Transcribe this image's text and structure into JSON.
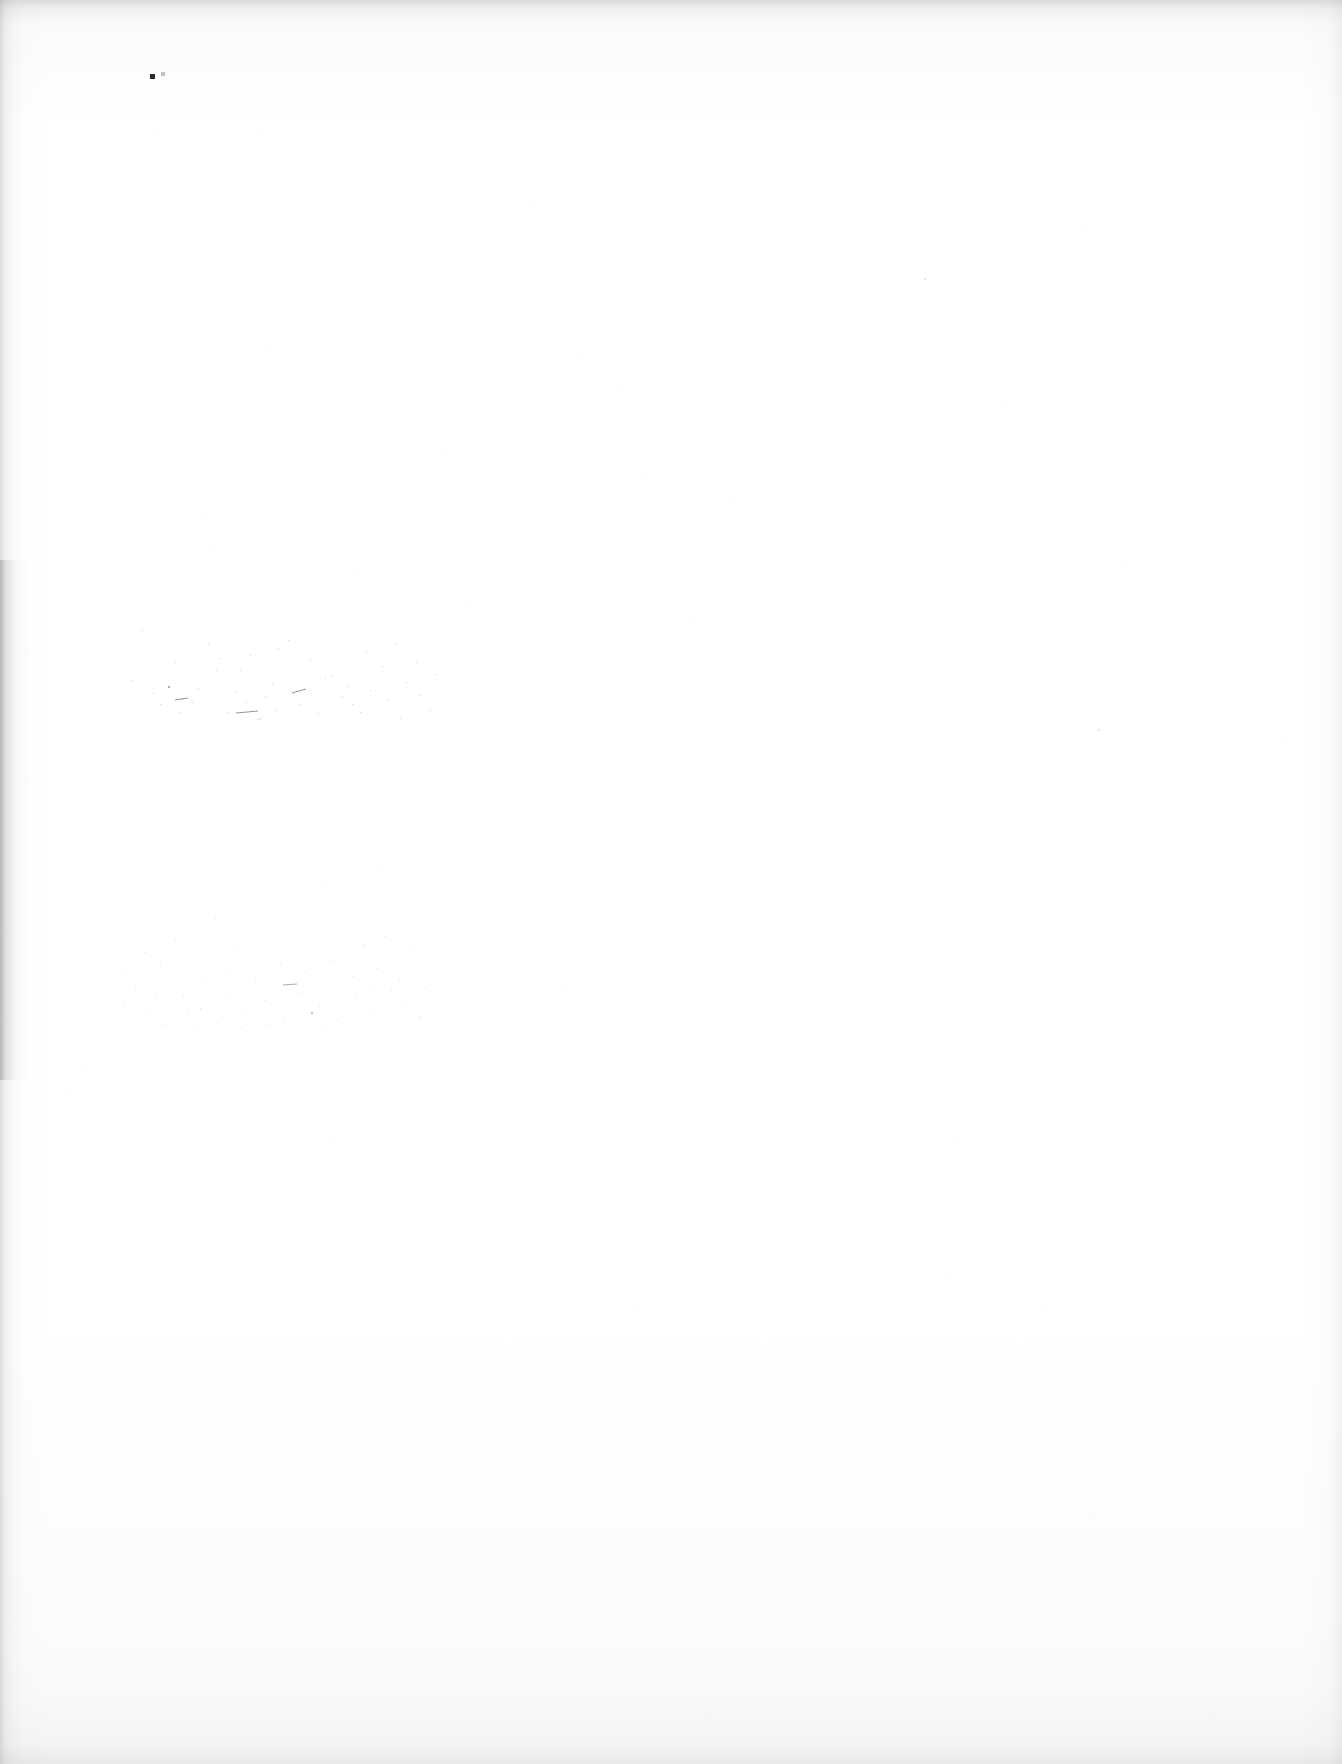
{
  "page": {
    "kind": "scanned-blank-page",
    "width": 1342,
    "height": 1764,
    "visible_text": "",
    "note": ""
  },
  "colors": {
    "paper": "#ffffff",
    "paper_tint": "#fbfbfb",
    "edge_shadow": "#7a7c80",
    "speck_dark": "#2a2a2c",
    "speck_light": "#9a9a9e"
  },
  "artifacts": {
    "dark_speck": {
      "x": 150,
      "y": 74,
      "size": 5
    },
    "dark_speck_companion": {
      "x": 161,
      "y": 72,
      "size": 4
    },
    "smudge_bands": [
      {
        "name": "upper-left-smudge",
        "x": 120,
        "y": 600,
        "width": 330,
        "height": 120
      },
      {
        "name": "lower-left-smudge",
        "x": 105,
        "y": 900,
        "width": 330,
        "height": 130
      }
    ],
    "edges": {
      "left_shadow_width": 46,
      "right_shadow_width": 40,
      "top_band_height": 34,
      "bottom_band_height": 70
    }
  },
  "specks_generic": [
    [
      153,
      131,
      1
    ],
    [
      258,
      135,
      1
    ],
    [
      530,
      202,
      1
    ],
    [
      1083,
      227,
      1
    ],
    [
      924,
      278,
      2
    ],
    [
      266,
      350,
      1
    ],
    [
      577,
      355,
      1
    ],
    [
      1003,
      402,
      1
    ],
    [
      616,
      389,
      1
    ],
    [
      641,
      479,
      1
    ],
    [
      206,
      519,
      1
    ],
    [
      210,
      551,
      1
    ],
    [
      356,
      568,
      1
    ],
    [
      1124,
      560,
      1
    ],
    [
      1098,
      729,
      2
    ],
    [
      1283,
      742,
      1
    ],
    [
      20,
      637,
      1
    ],
    [
      28,
      654,
      1
    ],
    [
      13,
      723,
      1
    ],
    [
      15,
      757,
      1
    ],
    [
      24,
      782,
      1
    ],
    [
      9,
      812,
      1
    ],
    [
      12,
      835,
      1
    ],
    [
      17,
      880,
      1
    ],
    [
      6,
      930,
      1
    ],
    [
      9,
      955,
      1
    ],
    [
      14,
      988,
      1
    ],
    [
      18,
      1010,
      1
    ],
    [
      11,
      1038,
      1
    ],
    [
      22,
      1062,
      1
    ],
    [
      378,
      866,
      1
    ],
    [
      323,
      884,
      1
    ],
    [
      560,
      986,
      1
    ],
    [
      372,
      990,
      1
    ],
    [
      27,
      1092,
      1
    ],
    [
      330,
      1138,
      1
    ],
    [
      955,
      1143,
      1
    ],
    [
      944,
      1272,
      1
    ],
    [
      1043,
      1306,
      1
    ],
    [
      1071,
      1424,
      1
    ],
    [
      633,
      1307,
      1
    ],
    [
      548,
      1353,
      1
    ],
    [
      755,
      1404,
      1
    ],
    [
      319,
      1452,
      1
    ],
    [
      1165,
      1479,
      1
    ],
    [
      410,
      1497,
      1
    ],
    [
      1088,
      1514,
      1
    ],
    [
      264,
      1562,
      1
    ],
    [
      612,
      1576,
      1
    ],
    [
      859,
      1594,
      1
    ],
    [
      450,
      1626,
      1
    ],
    [
      990,
      1651,
      1
    ],
    [
      137,
      1683,
      1
    ],
    [
      706,
      1712,
      1
    ],
    [
      1210,
      1716,
      1
    ],
    [
      84,
      1064,
      1
    ],
    [
      66,
      1091,
      1
    ],
    [
      443,
      451,
      1
    ],
    [
      470,
      601,
      1
    ],
    [
      735,
      497,
      1
    ],
    [
      688,
      620,
      1
    ]
  ],
  "specks_band_a": [
    [
      22,
      30,
      1
    ],
    [
      145,
      96,
      1
    ],
    [
      190,
      60,
      1
    ],
    [
      212,
      75,
      1
    ],
    [
      228,
      86,
      1
    ],
    [
      246,
      51,
      1
    ],
    [
      205,
      78,
      1
    ],
    [
      168,
      40,
      1
    ],
    [
      130,
      55,
      1
    ],
    [
      96,
      70,
      1
    ],
    [
      78,
      88,
      1
    ],
    [
      62,
      99,
      1
    ],
    [
      40,
      104,
      1
    ],
    [
      115,
      92,
      1
    ],
    [
      155,
      110,
      1
    ],
    [
      180,
      104,
      1
    ],
    [
      198,
      113,
      1
    ],
    [
      222,
      96,
      1
    ],
    [
      250,
      90,
      1
    ],
    [
      268,
      100,
      1
    ],
    [
      286,
      82,
      1
    ],
    [
      300,
      95,
      1
    ],
    [
      140,
      118,
      1
    ],
    [
      170,
      120,
      1
    ],
    [
      12,
      80,
      1
    ],
    [
      55,
      62,
      1
    ],
    [
      88,
      44,
      1
    ],
    [
      262,
      66,
      1
    ],
    [
      280,
      118,
      1
    ],
    [
      310,
      110,
      1
    ],
    [
      48,
      86,
      2
    ],
    [
      72,
      102,
      1
    ],
    [
      108,
      112,
      1
    ],
    [
      126,
      102,
      1
    ],
    [
      214,
      120,
      1
    ],
    [
      240,
      112,
      1
    ],
    [
      33,
      93,
      1
    ],
    [
      60,
      112,
      1
    ],
    [
      92,
      120,
      1
    ],
    [
      152,
      84,
      1
    ],
    [
      188,
      90,
      1
    ],
    [
      232,
      104,
      1
    ],
    [
      158,
      48,
      1
    ],
    [
      276,
      44,
      1
    ],
    [
      296,
      62,
      1
    ],
    [
      316,
      74,
      1
    ],
    [
      120,
      70,
      1
    ],
    [
      100,
      58,
      1
    ]
  ],
  "specks_band_b": [
    [
      110,
      18,
      1
    ],
    [
      70,
      40,
      1
    ],
    [
      55,
      62,
      1
    ],
    [
      30,
      86,
      1
    ],
    [
      18,
      102,
      1
    ],
    [
      44,
      110,
      1
    ],
    [
      78,
      96,
      1
    ],
    [
      95,
      108,
      1
    ],
    [
      120,
      94,
      1
    ],
    [
      140,
      112,
      1
    ],
    [
      160,
      100,
      1
    ],
    [
      178,
      118,
      1
    ],
    [
      196,
      92,
      1
    ],
    [
      214,
      106,
      1
    ],
    [
      232,
      120,
      1
    ],
    [
      250,
      98,
      1
    ],
    [
      268,
      110,
      1
    ],
    [
      286,
      90,
      1
    ],
    [
      300,
      104,
      1
    ],
    [
      315,
      116,
      1
    ],
    [
      125,
      70,
      1
    ],
    [
      150,
      78,
      1
    ],
    [
      175,
      64,
      1
    ],
    [
      200,
      72,
      1
    ],
    [
      225,
      60,
      1
    ],
    [
      248,
      76,
      1
    ],
    [
      272,
      68,
      1
    ],
    [
      294,
      80,
      1
    ],
    [
      60,
      124,
      1
    ],
    [
      88,
      126,
      1
    ],
    [
      112,
      122,
      1
    ],
    [
      136,
      128,
      1
    ],
    [
      164,
      124,
      1
    ],
    [
      190,
      130,
      1
    ],
    [
      216,
      126,
      1
    ],
    [
      240,
      130,
      1
    ],
    [
      40,
      52,
      1
    ],
    [
      20,
      70,
      1
    ],
    [
      305,
      50,
      1
    ],
    [
      320,
      88,
      1
    ],
    [
      258,
      44,
      1
    ],
    [
      280,
      36,
      1
    ],
    [
      330,
      62,
      1
    ],
    [
      128,
      46,
      1
    ],
    [
      100,
      80,
      1
    ],
    [
      82,
      112,
      1
    ],
    [
      50,
      98,
      1
    ],
    [
      206,
      112,
      2
    ]
  ]
}
